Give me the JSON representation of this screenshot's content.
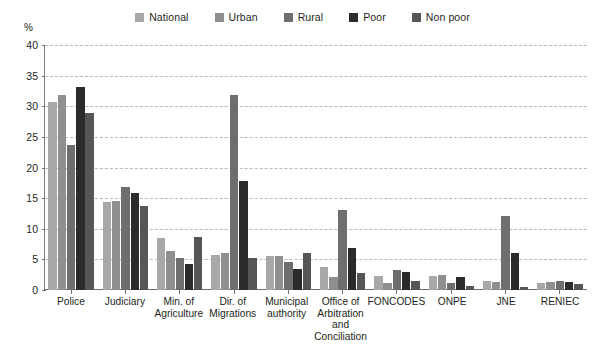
{
  "chart_data": {
    "type": "bar",
    "title": "",
    "xlabel": "",
    "ylabel": "%",
    "ylim": [
      0,
      40
    ],
    "yticks": [
      0,
      5,
      10,
      15,
      20,
      25,
      30,
      35,
      40
    ],
    "grid": true,
    "legend_position": "top-center",
    "categories": [
      "Police",
      "Judiciary",
      "Min. of\nAgriculture",
      "Dir. of\nMigrations",
      "Municipal\nauthority",
      "Office of\nArbitration\nand Conciliation",
      "FONCODES",
      "ONPE",
      "JNE",
      "RENIEC"
    ],
    "series": [
      {
        "name": "National",
        "color": "#a8a8a8",
        "values": [
          30.7,
          14.3,
          8.5,
          5.7,
          5.5,
          3.7,
          2.3,
          2.3,
          1.5,
          1.2
        ]
      },
      {
        "name": "Urban",
        "color": "#8f8f8f",
        "values": [
          31.8,
          14.6,
          6.3,
          6.0,
          5.5,
          2.2,
          1.2,
          2.5,
          1.3,
          1.3
        ]
      },
      {
        "name": "Rural",
        "color": "#6e6e6e",
        "values": [
          23.7,
          16.9,
          5.2,
          31.9,
          4.5,
          13.0,
          3.3,
          1.2,
          12.1,
          1.5
        ]
      },
      {
        "name": "Poor",
        "color": "#2b2b2b",
        "values": [
          33.2,
          15.9,
          4.2,
          17.8,
          3.5,
          6.8,
          2.9,
          2.1,
          6.0,
          1.3
        ]
      },
      {
        "name": "Non poor",
        "color": "#565656",
        "values": [
          28.9,
          13.7,
          8.7,
          5.2,
          6.0,
          2.7,
          1.5,
          0.7,
          0.5,
          1.0
        ]
      }
    ]
  },
  "axis": {
    "unit_label": "%"
  }
}
